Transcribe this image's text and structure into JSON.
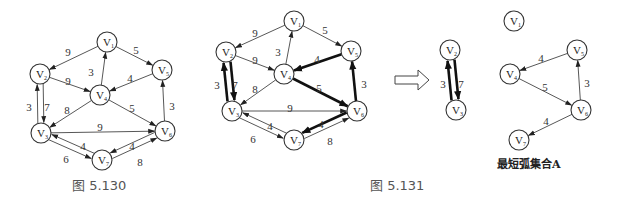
{
  "figures": [
    {
      "id": "fig1",
      "caption": "图 5.130",
      "caption_pos": [
        72,
        190
      ],
      "nodes": [
        {
          "id": "V1",
          "label": "V",
          "sub": "1",
          "x": 107,
          "y": 42
        },
        {
          "id": "V2",
          "label": "V",
          "sub": "2",
          "x": 40,
          "y": 74
        },
        {
          "id": "V3",
          "label": "V",
          "sub": "3",
          "x": 41,
          "y": 133
        },
        {
          "id": "V4",
          "label": "V",
          "sub": "4",
          "x": 100,
          "y": 95
        },
        {
          "id": "V5",
          "label": "V",
          "sub": "5",
          "x": 162,
          "y": 70
        },
        {
          "id": "V6",
          "label": "V",
          "sub": "6",
          "x": 165,
          "y": 131
        },
        {
          "id": "V7",
          "label": "V",
          "sub": "7",
          "x": 102,
          "y": 160
        }
      ],
      "edges": [
        {
          "from": "V1",
          "to": "V2",
          "weight": "9",
          "bold": false,
          "lx": 68,
          "ly": 52
        },
        {
          "from": "V1",
          "to": "V5",
          "weight": "5",
          "bold": false,
          "lx": 136,
          "ly": 50
        },
        {
          "from": "V4",
          "to": "V1",
          "weight": "3",
          "bold": false,
          "lx": 91,
          "ly": 72
        },
        {
          "from": "V2",
          "to": "V4",
          "weight": "9",
          "bold": false,
          "lx": 68,
          "ly": 81
        },
        {
          "from": "V5",
          "to": "V4",
          "weight": "4",
          "bold": false,
          "lx": 130,
          "ly": 78
        },
        {
          "from": "V2",
          "to": "V3",
          "weight": "3",
          "bold": false,
          "lx": 29,
          "ly": 107,
          "offset": -3
        },
        {
          "from": "V3",
          "to": "V2",
          "weight": "7",
          "bold": false,
          "lx": 47,
          "ly": 107,
          "offset": -3
        },
        {
          "from": "V4",
          "to": "V3",
          "weight": "8",
          "bold": false,
          "lx": 67,
          "ly": 110
        },
        {
          "from": "V4",
          "to": "V6",
          "weight": "5",
          "bold": false,
          "lx": 132,
          "ly": 108
        },
        {
          "from": "V6",
          "to": "V5",
          "weight": "3",
          "bold": false,
          "lx": 172,
          "ly": 106
        },
        {
          "from": "V3",
          "to": "V6",
          "weight": "9",
          "bold": false,
          "lx": 100,
          "ly": 127
        },
        {
          "from": "V3",
          "to": "V7",
          "weight": "6",
          "bold": false,
          "lx": 66,
          "ly": 159,
          "offset": 3
        },
        {
          "from": "V7",
          "to": "V3",
          "weight": "4",
          "bold": false,
          "lx": 83,
          "ly": 146,
          "offset": 3
        },
        {
          "from": "V6",
          "to": "V7",
          "weight": "4",
          "bold": false,
          "lx": 132,
          "ly": 146,
          "offset": 3
        },
        {
          "from": "V7",
          "to": "V6",
          "weight": "8",
          "bold": false,
          "lx": 140,
          "ly": 162,
          "offset": 3
        }
      ]
    },
    {
      "id": "fig2",
      "caption": "图 5.131",
      "caption_pos": [
        370,
        190
      ],
      "nodes": [
        {
          "id": "V1",
          "label": "V",
          "sub": "1",
          "x": 294,
          "y": 21
        },
        {
          "id": "V2",
          "label": "V",
          "sub": "2",
          "x": 226,
          "y": 52
        },
        {
          "id": "V3",
          "label": "V",
          "sub": "3",
          "x": 232,
          "y": 111
        },
        {
          "id": "V4",
          "label": "V",
          "sub": "4",
          "x": 284,
          "y": 74
        },
        {
          "id": "V5",
          "label": "V",
          "sub": "5",
          "x": 351,
          "y": 51
        },
        {
          "id": "V6",
          "label": "V",
          "sub": "6",
          "x": 357,
          "y": 111
        },
        {
          "id": "V7",
          "label": "V",
          "sub": "7",
          "x": 294,
          "y": 140
        }
      ],
      "edges": [
        {
          "from": "V1",
          "to": "V2",
          "weight": "9",
          "bold": false,
          "lx": 255,
          "ly": 33
        },
        {
          "from": "V1",
          "to": "V5",
          "weight": "5",
          "bold": false,
          "lx": 325,
          "ly": 30
        },
        {
          "from": "V4",
          "to": "V1",
          "weight": "3",
          "bold": false,
          "lx": 278,
          "ly": 52
        },
        {
          "from": "V2",
          "to": "V4",
          "weight": "9",
          "bold": false,
          "lx": 255,
          "ly": 60
        },
        {
          "from": "V5",
          "to": "V4",
          "weight": "4",
          "bold": true,
          "lx": 317,
          "ly": 59
        },
        {
          "from": "V2",
          "to": "V3",
          "weight": "3",
          "bold": true,
          "lx": 217,
          "ly": 85,
          "offset": -3.5
        },
        {
          "from": "V3",
          "to": "V2",
          "weight": "7",
          "bold": true,
          "lx": 235,
          "ly": 85,
          "offset": -3.5
        },
        {
          "from": "V4",
          "to": "V3",
          "weight": "8",
          "bold": false,
          "lx": 255,
          "ly": 89
        },
        {
          "from": "V4",
          "to": "V6",
          "weight": "5",
          "bold": true,
          "lx": 319,
          "ly": 88
        },
        {
          "from": "V6",
          "to": "V5",
          "weight": "3",
          "bold": true,
          "lx": 364,
          "ly": 84
        },
        {
          "from": "V3",
          "to": "V6",
          "weight": "9",
          "bold": false,
          "lx": 290,
          "ly": 108
        },
        {
          "from": "V3",
          "to": "V7",
          "weight": "6",
          "bold": false,
          "lx": 253,
          "ly": 139,
          "offset": 3
        },
        {
          "from": "V7",
          "to": "V3",
          "weight": "4",
          "bold": false,
          "lx": 270,
          "ly": 126,
          "offset": 3
        },
        {
          "from": "V6",
          "to": "V7",
          "weight": "4",
          "bold": true,
          "lx": 321,
          "ly": 124,
          "offset": 3
        },
        {
          "from": "V7",
          "to": "V6",
          "weight": "8",
          "bold": false,
          "lx": 330,
          "ly": 141,
          "offset": 3
        }
      ]
    },
    {
      "id": "fig3",
      "caption": "最短弧集合A",
      "caption_pos": [
        497,
        168
      ],
      "nodes": [
        {
          "id": "V2",
          "label": "V",
          "sub": "2",
          "x": 450,
          "y": 50
        },
        {
          "id": "V3",
          "label": "V",
          "sub": "3",
          "x": 456,
          "y": 110
        },
        {
          "id": "V1",
          "label": "V",
          "sub": "1",
          "x": 514,
          "y": 21
        },
        {
          "id": "V4",
          "label": "V",
          "sub": "4",
          "x": 510,
          "y": 74
        },
        {
          "id": "V5",
          "label": "V",
          "sub": "5",
          "x": 577,
          "y": 50
        },
        {
          "id": "V6",
          "label": "V",
          "sub": "6",
          "x": 581,
          "y": 110
        },
        {
          "id": "V7",
          "label": "V",
          "sub": "7",
          "x": 519,
          "y": 140
        }
      ],
      "edges": [
        {
          "from": "V2",
          "to": "V3",
          "weight": "3",
          "bold": true,
          "lx": 443,
          "ly": 84,
          "offset": -3.5
        },
        {
          "from": "V3",
          "to": "V2",
          "weight": "7",
          "bold": true,
          "lx": 461,
          "ly": 84,
          "offset": -3.5
        },
        {
          "from": "V5",
          "to": "V4",
          "weight": "4",
          "bold": false,
          "lx": 541,
          "ly": 58
        },
        {
          "from": "V4",
          "to": "V6",
          "weight": "5",
          "bold": false,
          "lx": 545,
          "ly": 87
        },
        {
          "from": "V6",
          "to": "V5",
          "weight": "3",
          "bold": false,
          "lx": 587,
          "ly": 83
        },
        {
          "from": "V6",
          "to": "V7",
          "weight": "4",
          "bold": false,
          "lx": 546,
          "ly": 121
        }
      ]
    }
  ],
  "transform_arrow": {
    "x1": 395,
    "x2": 428,
    "y": 80,
    "label": "hollow-right-arrow"
  },
  "colors": {
    "stroke": "#333333",
    "node_fill": "#ffffff",
    "text": "#222222",
    "caption": "#555555"
  }
}
